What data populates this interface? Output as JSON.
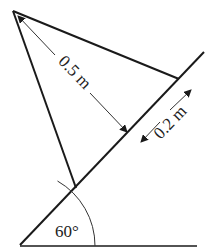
{
  "diagram": {
    "type": "physics-incline-triangle",
    "labels": {
      "long_distance": "0.5 m",
      "short_distance": "0.2 m",
      "angle": "60°"
    },
    "colors": {
      "line": "#1a1a1a",
      "arrow": "#333333",
      "background": "#ffffff"
    }
  }
}
